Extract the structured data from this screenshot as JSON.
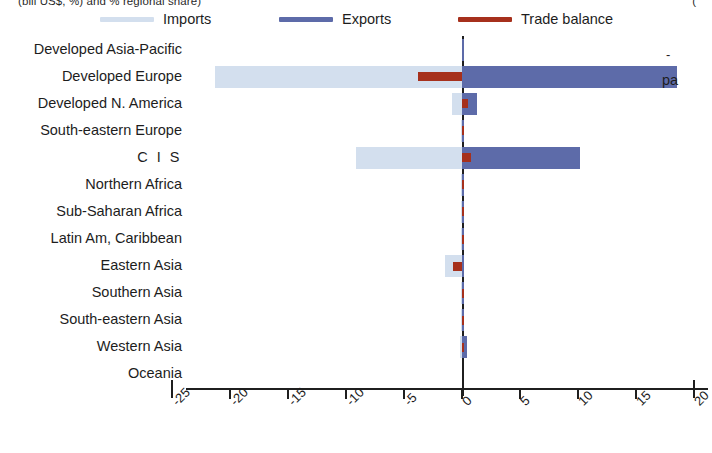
{
  "figure": {
    "top_fragment_left": "(bill US$, %) and % regional share)",
    "top_fragment_right": "(",
    "right_fragment": "pa",
    "tick_mark_fragment": "-"
  },
  "legend": {
    "position": "top",
    "items": [
      {
        "label": "Imports",
        "color": "#d3dfee",
        "name": "legend-imports"
      },
      {
        "label": "Exports",
        "color": "#5d6ba9",
        "name": "legend-exports"
      },
      {
        "label": "Trade balance",
        "color": "#a6301c",
        "name": "legend-trade-balance"
      }
    ]
  },
  "chart_data": {
    "type": "bar",
    "orientation": "horizontal",
    "title": "",
    "subtitle": "",
    "xlabel": "",
    "ylabel": "",
    "xlim": [
      -25,
      20
    ],
    "xticks": [
      -25,
      -20,
      -15,
      -10,
      -5,
      0,
      5,
      10,
      15,
      20
    ],
    "xtick_labels": [
      "-25",
      "-20",
      "-15",
      "-10",
      "-5",
      "0",
      "5",
      "10",
      "15",
      "20"
    ],
    "grid": false,
    "zero_line": 0,
    "legend_position": "top",
    "categories": [
      "Developed Asia-Pacific",
      "Developed Europe",
      "Developed N. America",
      "South-eastern Europe",
      "C I S",
      "Northern Africa",
      "Sub-Saharan Africa",
      "Latin Am, Caribbean",
      "Eastern Asia",
      "Southern Asia",
      "South-eastern Asia",
      "Western Asia",
      "Oceania"
    ],
    "series": [
      {
        "name": "Imports",
        "color": "#d3dfee",
        "values": [
          0.0,
          -21.3,
          -0.9,
          -0.1,
          -9.1,
          -0.1,
          -0.1,
          -0.1,
          -1.5,
          -0.05,
          -0.1,
          -0.2,
          0.0
        ]
      },
      {
        "name": "Exports",
        "color": "#5d6ba9",
        "values": [
          0.05,
          18.5,
          1.3,
          0.15,
          10.2,
          0.1,
          0.1,
          0.1,
          0.1,
          0.1,
          0.1,
          0.45,
          0.0
        ]
      },
      {
        "name": "Trade balance",
        "color": "#a6301c",
        "values": [
          0.0,
          -3.8,
          0.5,
          0.05,
          0.8,
          0.05,
          0.05,
          0.05,
          -0.8,
          0.15,
          0.05,
          0.1,
          0.0
        ]
      }
    ]
  }
}
